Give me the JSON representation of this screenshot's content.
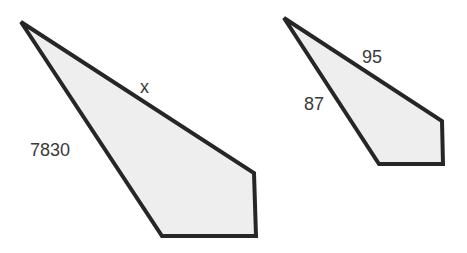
{
  "figure": {
    "type": "similar-polygons",
    "shapes": [
      {
        "id": "large",
        "labels": {
          "top_edge": "x",
          "left_edge": "7830"
        }
      },
      {
        "id": "small",
        "labels": {
          "top_edge": "95",
          "left_edge": "87"
        }
      }
    ],
    "colors": {
      "fill": "#eeeeee",
      "stroke": "#262626",
      "text": "#3a3a3a"
    }
  }
}
